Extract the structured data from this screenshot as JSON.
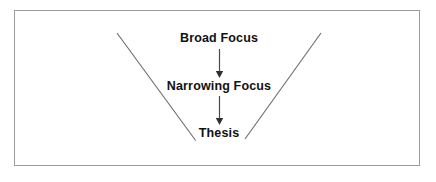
{
  "figure": {
    "frame": {
      "border_color": "#9a9a9a",
      "background_color": "#ffffff"
    }
  },
  "diagram": {
    "type": "funnel",
    "line_color": "#6b6b6b",
    "arrow_color": "#4a4a4a",
    "text_color": "#111111",
    "stages": [
      {
        "id": "broad-focus",
        "label": "Broad Focus",
        "order": 1
      },
      {
        "id": "narrowing-focus",
        "label": "Narrowing Focus",
        "order": 2
      },
      {
        "id": "thesis",
        "label": "Thesis",
        "order": 3
      }
    ],
    "connectors": [
      {
        "id": "arrow-broad-to-narrowing",
        "from": "broad-focus",
        "to": "narrowing-focus",
        "glyph": "down-arrow"
      },
      {
        "id": "arrow-narrowing-to-thesis",
        "from": "narrowing-focus",
        "to": "thesis",
        "glyph": "down-arrow"
      }
    ],
    "funnel_sides": [
      {
        "id": "funnel-left-side",
        "from": [
          117,
          33
        ],
        "to": [
          196,
          141
        ]
      },
      {
        "id": "funnel-right-side",
        "from": [
          321,
          33
        ],
        "to": [
          245,
          139
        ]
      }
    ]
  }
}
